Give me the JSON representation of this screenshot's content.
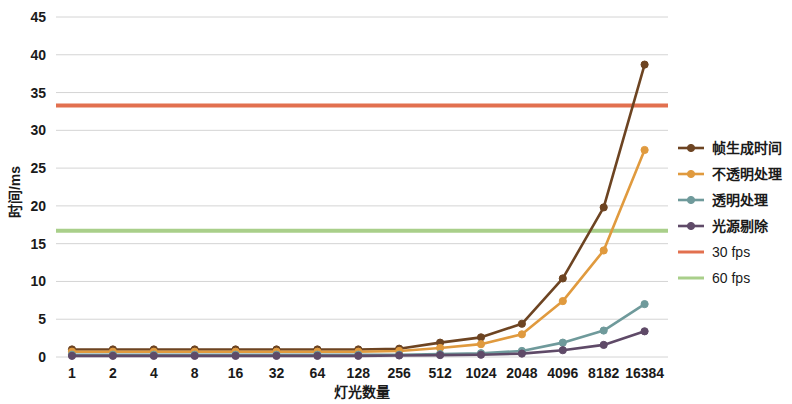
{
  "chart_data": {
    "type": "line",
    "title": "",
    "xlabel": "灯光数量",
    "ylabel": "时间/ms",
    "x_is_categorical": true,
    "categories": [
      "1",
      "2",
      "4",
      "8",
      "16",
      "32",
      "64",
      "128",
      "256",
      "512",
      "1024",
      "2048",
      "4096",
      "8182",
      "16384"
    ],
    "ylim": [
      0,
      45
    ],
    "yticks": [
      0,
      5,
      10,
      15,
      20,
      25,
      30,
      35,
      40,
      45
    ],
    "ytick_labels": [
      "0",
      "5",
      "10",
      "15",
      "20",
      "25",
      "30",
      "35",
      "40",
      "45"
    ],
    "grid": "horizontal",
    "legend_position": "right",
    "series": [
      {
        "name": "帧生成时间",
        "color": "#6d4422",
        "marker": "circle",
        "values": [
          1.0,
          1.0,
          1.0,
          1.0,
          1.0,
          1.0,
          1.0,
          1.0,
          1.1,
          1.9,
          2.6,
          4.4,
          10.4,
          19.8,
          38.7
        ]
      },
      {
        "name": "不透明处理",
        "color": "#e09a3e",
        "marker": "circle",
        "values": [
          0.7,
          0.7,
          0.7,
          0.7,
          0.7,
          0.7,
          0.7,
          0.7,
          0.8,
          1.2,
          1.7,
          3.0,
          7.4,
          14.1,
          27.4
        ]
      },
      {
        "name": "透明处理",
        "color": "#6f9a9b",
        "marker": "circle",
        "values": [
          0.3,
          0.3,
          0.3,
          0.3,
          0.3,
          0.3,
          0.3,
          0.3,
          0.3,
          0.4,
          0.5,
          0.8,
          1.9,
          3.5,
          7.0
        ]
      },
      {
        "name": "光源剔除",
        "color": "#5f4a68",
        "marker": "circle",
        "values": [
          0.15,
          0.15,
          0.15,
          0.15,
          0.15,
          0.15,
          0.15,
          0.15,
          0.2,
          0.25,
          0.3,
          0.45,
          0.9,
          1.6,
          3.4
        ]
      }
    ],
    "reference_lines": [
      {
        "name": "30 fps",
        "color": "#e2704f",
        "value": 33.3
      },
      {
        "name": "60 fps",
        "color": "#a9cf8a",
        "value": 16.7
      }
    ]
  }
}
